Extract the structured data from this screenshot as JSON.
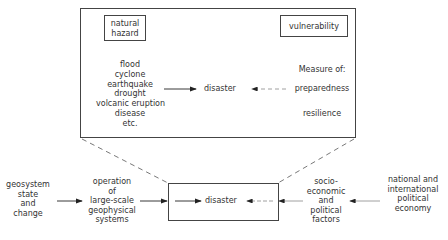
{
  "top_panel": {
    "natural_hazard_label": [
      "natural",
      "hazard"
    ],
    "vulnerability_label": "vulnerability",
    "hazards": [
      "flood",
      "cyclone",
      "earthquake",
      "drought",
      "volcanic eruption",
      "disease",
      "etc."
    ],
    "center_label": "disaster",
    "measure_label": "Measure of:",
    "measures": [
      "preparedness",
      "resilience"
    ]
  },
  "bottom_chain": {
    "geosystem": [
      "geosystem",
      "state",
      "and",
      "change"
    ],
    "operation": [
      "operation",
      "of",
      "large-scale",
      "geophysical",
      "systems"
    ],
    "center_label": "disaster",
    "socio": [
      "socio-",
      "economic",
      "and",
      "political",
      "factors"
    ],
    "national": [
      "national and",
      "international",
      "political",
      "economy"
    ]
  },
  "colors": {
    "line": "#444444",
    "text": "#333333",
    "background": "#ffffff"
  }
}
